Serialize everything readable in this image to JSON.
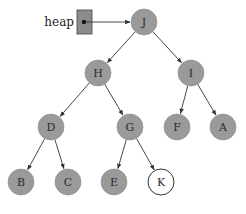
{
  "diagram": {
    "type": "binary-heap-tree",
    "colors": {
      "node_fill": "#9a9a9a",
      "node_stroke": "#8a8a8a",
      "new_node_fill": "#ffffff",
      "new_node_stroke": "#333333",
      "edge": "#333333",
      "heap_box_fill": "#8c8c8c"
    },
    "pointer": {
      "label": "heap",
      "box": {
        "x": 77,
        "y": 10,
        "w": 15,
        "h": 24
      },
      "dot": {
        "x": 84,
        "y": 22
      },
      "target": "J"
    },
    "node_radius": 13,
    "nodes": [
      {
        "id": "J",
        "label": "J",
        "x": 144,
        "y": 22,
        "highlight": false
      },
      {
        "id": "H",
        "label": "H",
        "x": 98,
        "y": 73,
        "highlight": false
      },
      {
        "id": "I",
        "label": "I",
        "x": 191,
        "y": 73,
        "highlight": false
      },
      {
        "id": "D",
        "label": "D",
        "x": 51,
        "y": 127,
        "highlight": false
      },
      {
        "id": "G",
        "label": "G",
        "x": 130,
        "y": 127,
        "highlight": false
      },
      {
        "id": "F",
        "label": "F",
        "x": 177,
        "y": 127,
        "highlight": false
      },
      {
        "id": "A",
        "label": "A",
        "x": 223,
        "y": 127,
        "highlight": false
      },
      {
        "id": "B",
        "label": "B",
        "x": 21,
        "y": 182,
        "highlight": false
      },
      {
        "id": "C",
        "label": "C",
        "x": 68,
        "y": 182,
        "highlight": false
      },
      {
        "id": "E",
        "label": "E",
        "x": 114,
        "y": 182,
        "highlight": false
      },
      {
        "id": "K",
        "label": "K",
        "x": 161,
        "y": 182,
        "highlight": true
      }
    ],
    "edges": [
      [
        "J",
        "H"
      ],
      [
        "J",
        "I"
      ],
      [
        "H",
        "D"
      ],
      [
        "H",
        "G"
      ],
      [
        "I",
        "F"
      ],
      [
        "I",
        "A"
      ],
      [
        "D",
        "B"
      ],
      [
        "D",
        "C"
      ],
      [
        "G",
        "E"
      ],
      [
        "G",
        "K"
      ]
    ]
  }
}
